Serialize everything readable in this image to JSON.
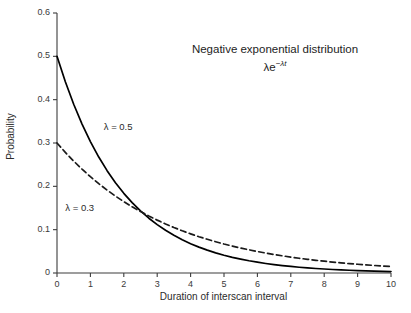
{
  "chart_data": {
    "type": "line",
    "title": "Negative exponential distribution",
    "formula_text": "λe−λt",
    "formula_base": "λe",
    "formula_exponent": "−λt",
    "xlabel": "Duration of interscan interval",
    "ylabel": "Probability",
    "xlim": [
      0,
      10
    ],
    "ylim": [
      0,
      0.6
    ],
    "xticks": [
      "0",
      "1",
      "2",
      "3",
      "4",
      "5",
      "6",
      "7",
      "8",
      "9",
      "10"
    ],
    "xtick_values": [
      0,
      1,
      2,
      3,
      4,
      5,
      6,
      7,
      8,
      9,
      10
    ],
    "yticks": [
      "0",
      "0.1",
      "0.2",
      "0.3",
      "0.4",
      "0.5",
      "0.6"
    ],
    "ytick_values": [
      0,
      0.1,
      0.2,
      0.3,
      0.4,
      0.5,
      0.6
    ],
    "grid": false,
    "legend_position": "inline-annotations",
    "x": [
      0,
      0.25,
      0.5,
      0.75,
      1,
      1.25,
      1.5,
      1.75,
      2,
      2.25,
      2.5,
      2.75,
      3,
      3.25,
      3.5,
      3.75,
      4,
      4.25,
      4.5,
      4.75,
      5,
      5.25,
      5.5,
      5.75,
      6,
      6.25,
      6.5,
      6.75,
      7,
      7.25,
      7.5,
      7.75,
      8,
      8.25,
      8.5,
      8.75,
      9,
      9.25,
      9.5,
      9.75,
      10
    ],
    "series": [
      {
        "name": "λ = 0.5",
        "lambda": 0.5,
        "style": "solid",
        "color": "#000000",
        "annotation": "λ = 0.5",
        "values": [
          0.5,
          0.4412,
          0.3894,
          0.3436,
          0.3033,
          0.2676,
          0.2362,
          0.2084,
          0.1839,
          0.1623,
          0.1433,
          0.1264,
          0.1116,
          0.0985,
          0.0869,
          0.0767,
          0.0677,
          0.0597,
          0.0527,
          0.0465,
          0.041,
          0.0362,
          0.032,
          0.0282,
          0.0249,
          0.022,
          0.0194,
          0.0171,
          0.0151,
          0.0133,
          0.0118,
          0.0104,
          0.0092,
          0.0081,
          0.0071,
          0.0063,
          0.0056,
          0.0049,
          0.0043,
          0.0038,
          0.0034
        ]
      },
      {
        "name": "λ = 0.3",
        "lambda": 0.3,
        "style": "dashed",
        "color": "#1a1a1a",
        "annotation": "λ = 0.3",
        "values": [
          0.3,
          0.2783,
          0.2582,
          0.2396,
          0.2222,
          0.2062,
          0.1913,
          0.1775,
          0.1646,
          0.1527,
          0.1417,
          0.1315,
          0.122,
          0.1131,
          0.105,
          0.0974,
          0.0904,
          0.0838,
          0.0778,
          0.0722,
          0.0669,
          0.0621,
          0.0576,
          0.0535,
          0.0496,
          0.046,
          0.0427,
          0.0396,
          0.0367,
          0.0341,
          0.0316,
          0.0293,
          0.0272,
          0.0253,
          0.0234,
          0.0217,
          0.0202,
          0.0187,
          0.0174,
          0.0161,
          0.0149
        ]
      }
    ],
    "annotations": [
      {
        "text": "λ = 0.5",
        "x": 1.4,
        "y": 0.335
      },
      {
        "text": "λ = 0.3",
        "x": 0.25,
        "y": 0.147
      }
    ],
    "colors": {
      "axis": "#3c3c3c",
      "text": "#2b2b2b",
      "solid_series": "#000000",
      "dashed_series": "#1a1a1a",
      "background": "#ffffff"
    }
  }
}
